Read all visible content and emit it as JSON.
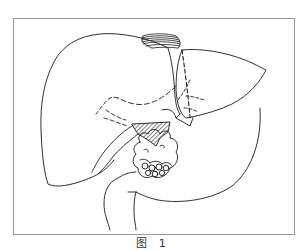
{
  "figure": {
    "caption": "图 1",
    "parts": [
      {
        "name": "right-lobe",
        "style": "solid-outline"
      },
      {
        "name": "left-lobe",
        "style": "solid-outline"
      },
      {
        "name": "resection-line",
        "style": "dashed"
      },
      {
        "name": "diaphragm-vessel",
        "style": "hatched-coil"
      },
      {
        "name": "hilar-region",
        "style": "hatched"
      },
      {
        "name": "tumor-mass",
        "style": "lobulated"
      },
      {
        "name": "bile-duct-branches",
        "style": "dashed"
      },
      {
        "name": "duodenum",
        "style": "solid-outline"
      }
    ],
    "colors": {
      "line": "#1a1a1a",
      "frame": "#9a9a9a",
      "background": "#ffffff"
    }
  }
}
